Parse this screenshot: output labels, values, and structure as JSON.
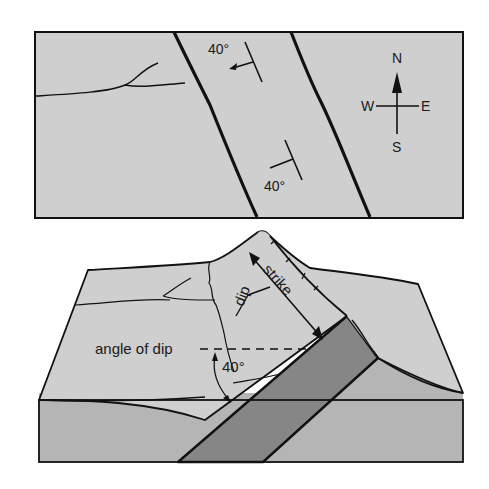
{
  "map_view": {
    "strike_symbols": [
      {
        "label": "40°",
        "dip_direction": "west"
      },
      {
        "label": "40°",
        "dip_direction": "west"
      }
    ],
    "compass": {
      "north": "N",
      "south": "S",
      "east": "E",
      "west": "W"
    }
  },
  "block_view": {
    "labels": {
      "strike": "strike",
      "dip": "dip",
      "angle_of_dip": "angle of dip",
      "angle_value": "40°"
    }
  },
  "colors": {
    "surface": "#cfcfcf",
    "front_face": "#b5b5b5",
    "bed": "#868686",
    "line": "#111111"
  }
}
